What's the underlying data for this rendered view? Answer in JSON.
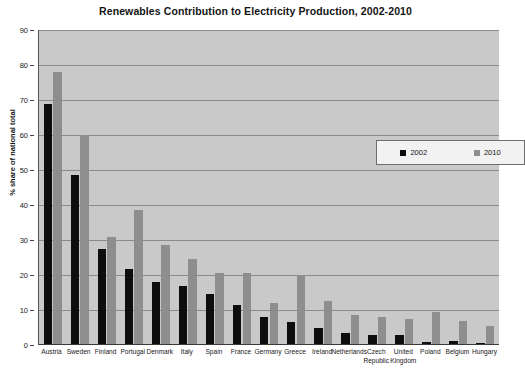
{
  "chart_data": {
    "type": "bar",
    "title": "Renewables Contribution to Electricity Production, 2002-2010",
    "xlabel": "",
    "ylabel": "% share of national total",
    "ylim": [
      0,
      90
    ],
    "ytick_step": 10,
    "yticks": [
      "0",
      "10",
      "20",
      "30",
      "40",
      "50",
      "60",
      "70",
      "80",
      "90"
    ],
    "grid": true,
    "legend_position": "upper-right-inside",
    "categories": [
      "Austria",
      "Sweden",
      "Finland",
      "Portugal",
      "Denmark",
      "Italy",
      "Spain",
      "France",
      "Germany",
      "Greece",
      "Ireland",
      "Netherlands",
      "Czech\nRepublic",
      "United\nKingdom",
      "Poland",
      "Belgium",
      "Hungary"
    ],
    "series": [
      {
        "name": "2002",
        "color": "#0d0d0d",
        "values": [
          69,
          48.5,
          27.5,
          21.8,
          18,
          17,
          14.5,
          11.5,
          8,
          6.5,
          5,
          3.5,
          3,
          2.8,
          1,
          1.2,
          0.6
        ]
      },
      {
        "name": "2010",
        "color": "#8e8e8e",
        "values": [
          78,
          60,
          31,
          38.5,
          28.5,
          24.5,
          20.5,
          20.5,
          12,
          20,
          12.5,
          8.5,
          8,
          7.5,
          9.5,
          7,
          5.5
        ]
      }
    ]
  },
  "legend": {
    "items": [
      {
        "label": "2002",
        "swatch": "black-square"
      },
      {
        "label": "2010",
        "swatch": "gray-square"
      }
    ]
  }
}
